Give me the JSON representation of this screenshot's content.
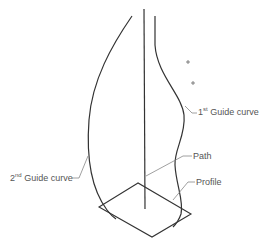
{
  "diagram": {
    "type": "sweep-with-guide-curves",
    "labels": {
      "guide1": {
        "ordinal": "1",
        "suffix": "st",
        "text": " Guide curve"
      },
      "guide2": {
        "ordinal": "2",
        "suffix": "nd",
        "text": " Guide curve"
      },
      "path": "Path",
      "profile": "Profile"
    },
    "markers": [
      "plus-point-1",
      "plus-point-2"
    ],
    "colors": {
      "line": "#333333",
      "leader": "#888888",
      "text": "#555555",
      "background": "#ffffff"
    }
  }
}
